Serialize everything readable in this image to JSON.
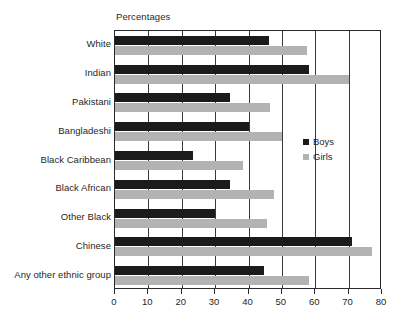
{
  "chart_data": {
    "type": "bar",
    "orientation": "horizontal",
    "title": "",
    "xlabel": "Percentages",
    "ylabel": "",
    "xlim": [
      0,
      80
    ],
    "xticks": [
      0,
      10,
      20,
      30,
      40,
      50,
      60,
      70,
      80
    ],
    "xtick_labels": [
      "0",
      "10",
      "20",
      "30",
      "40",
      "50",
      "60",
      "70",
      "80"
    ],
    "grid": true,
    "grid_axis": "x",
    "legend_position": "center-right",
    "categories": [
      "White",
      "Indian",
      "Pakistani",
      "Bangladeshi",
      "Black Caribbean",
      "Black African",
      "Other Black",
      "Chinese",
      "Any other ethnic group"
    ],
    "series": [
      {
        "name": "Boys",
        "color": "#1b1b1b",
        "values": [
          46,
          58,
          34.5,
          40,
          23.5,
          34.5,
          30,
          71,
          44.5
        ]
      },
      {
        "name": "Girls",
        "color": "#b3b3b3",
        "values": [
          57.5,
          70,
          46.5,
          50,
          38.5,
          47.5,
          45.5,
          77,
          58
        ]
      }
    ]
  },
  "legend": {
    "items": [
      {
        "label": "Boys",
        "color": "#1b1b1b"
      },
      {
        "label": "Girls",
        "color": "#b3b3b3"
      }
    ]
  }
}
